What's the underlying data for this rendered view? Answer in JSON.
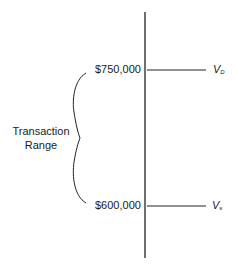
{
  "diagram": {
    "range_label_line1": "Transaction",
    "range_label_line2": "Range",
    "upper": {
      "value": "$750,000",
      "symbol": "V",
      "subscript": "D"
    },
    "lower": {
      "value": "$600,000",
      "symbol": "V",
      "subscript": "s"
    }
  }
}
